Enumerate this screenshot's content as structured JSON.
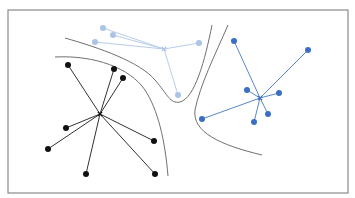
{
  "diagram": {
    "type": "clustering-decision-boundaries",
    "frame": {
      "x": 8,
      "y": 10,
      "width": 340,
      "height": 183,
      "stroke": "#8a8a8a"
    },
    "boundary_color": "#707070",
    "boundaries": [
      {
        "name": "boundary-left-outer",
        "path": "M 55 57 C 95 55, 130 68, 145 90 C 158 110, 165 140, 168 176"
      },
      {
        "name": "boundary-left-inner",
        "path": "M 65 38 C 100 48, 140 62, 155 80 C 168 95, 170 104, 180 102 C 195 98, 205 60, 212 25"
      },
      {
        "name": "boundary-right",
        "path": "M 228 25 C 215 55, 200 85, 195 110 C 192 132, 220 145, 262 155"
      }
    ],
    "clusters": [
      {
        "name": "cluster-black",
        "color": "#111111",
        "line_color": "#333333",
        "center": [
          100,
          114
        ],
        "points": [
          [
            68,
            65
          ],
          [
            114,
            69
          ],
          [
            123,
            78
          ],
          [
            66,
            128
          ],
          [
            48,
            149
          ],
          [
            86,
            174
          ],
          [
            154,
            141
          ],
          [
            155,
            174
          ]
        ]
      },
      {
        "name": "cluster-light-blue",
        "color": "#a9c4e6",
        "line_color": "#b8cde9",
        "center": [
          164,
          49
        ],
        "points": [
          [
            103,
            28
          ],
          [
            113,
            35
          ],
          [
            95,
            42
          ],
          [
            199,
            43
          ],
          [
            178,
            95
          ]
        ]
      },
      {
        "name": "cluster-blue",
        "color": "#3a6fc4",
        "line_color": "#5a86cc",
        "center": [
          260,
          98
        ],
        "points": [
          [
            234,
            41
          ],
          [
            308,
            50
          ],
          [
            247,
            90
          ],
          [
            279,
            93
          ],
          [
            268,
            114
          ],
          [
            254,
            122
          ],
          [
            202,
            119
          ]
        ]
      }
    ]
  }
}
